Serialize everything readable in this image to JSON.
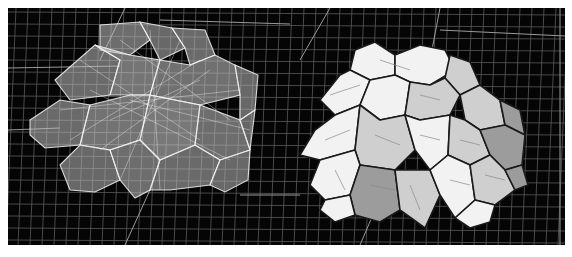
{
  "figure": {
    "width": 572,
    "height": 257,
    "background": "#ffffff",
    "panel": {
      "x": 8,
      "y": 8,
      "w": 557,
      "h": 237,
      "fill": "#050505"
    },
    "colors": {
      "grid_minor": "#5a5a5a",
      "grid_major": "#9a9a9a",
      "wire_edge": "#f4f4f4",
      "solid_edge": "#1a1a1a",
      "face_light": "#f2f2f2",
      "face_mid": "#cfcfcf",
      "face_dark": "#9c9c9c"
    },
    "views": [
      {
        "name": "transparent-wireframe-view",
        "label": ""
      },
      {
        "name": "solid-shaded-view",
        "label": ""
      }
    ]
  },
  "grid": {
    "h_lines": [
      12,
      24,
      36,
      48,
      60,
      72,
      84,
      96,
      108,
      120,
      132,
      144,
      156,
      168,
      180,
      192,
      204,
      216,
      228,
      240
    ],
    "v_lines": [
      10,
      22,
      34,
      46,
      58,
      70,
      82,
      94,
      106,
      118,
      130,
      142,
      154,
      166,
      178,
      190,
      202,
      214,
      226,
      238,
      250,
      262,
      274,
      286,
      298,
      310,
      322,
      334,
      346,
      358,
      370,
      382,
      394,
      406,
      418,
      430,
      442,
      454,
      466,
      478,
      490,
      502,
      514,
      526,
      538,
      550,
      562
    ],
    "major": [
      [
        8,
        68,
        120,
        66
      ],
      [
        8,
        130,
        60,
        128
      ],
      [
        125,
        8,
        100,
        60
      ],
      [
        125,
        245,
        150,
        190
      ],
      [
        160,
        20,
        290,
        24
      ],
      [
        300,
        60,
        330,
        8
      ],
      [
        440,
        8,
        430,
        60
      ],
      [
        440,
        30,
        565,
        36
      ],
      [
        360,
        245,
        375,
        210
      ],
      [
        560,
        8,
        560,
        245
      ],
      [
        240,
        195,
        300,
        195
      ]
    ]
  },
  "left_cluster": {
    "faces": [
      {
        "pts": "100,25 140,22 150,40 130,55 100,50",
        "shade": 0.55
      },
      {
        "pts": "140,22 172,28 185,48 160,60 150,40",
        "shade": 0.45
      },
      {
        "pts": "172,28 205,30 215,55 190,65 185,48",
        "shade": 0.5
      },
      {
        "pts": "55,80 95,45 120,60 110,95 70,100",
        "shade": 0.5
      },
      {
        "pts": "95,45 130,55 160,60 150,95 110,95 120,60",
        "shade": 0.7
      },
      {
        "pts": "160,60 190,65 215,55 235,65 240,95 200,105 150,95",
        "shade": 0.6
      },
      {
        "pts": "235,65 258,75 255,110 240,120 240,95",
        "shade": 0.45
      },
      {
        "pts": "30,120 60,100 90,105 80,145 45,148 30,135",
        "shade": 0.5
      },
      {
        "pts": "90,105 130,95 150,95 140,140 110,150 80,145",
        "shade": 0.65
      },
      {
        "pts": "150,95 200,105 195,145 160,160 140,140",
        "shade": 0.75
      },
      {
        "pts": "200,105 240,120 250,150 220,160 195,145",
        "shade": 0.55
      },
      {
        "pts": "240,120 255,110 250,150",
        "shade": 0.4
      },
      {
        "pts": "60,165 80,145 110,150 120,180 95,192 70,190",
        "shade": 0.45
      },
      {
        "pts": "110,150 140,140 160,160 150,190 135,198 120,180",
        "shade": 0.55
      },
      {
        "pts": "160,160 195,145 220,160 210,185 170,190 150,190",
        "shade": 0.5
      },
      {
        "pts": "220,160 250,150 248,180 225,192 210,185",
        "shade": 0.45
      }
    ],
    "fill": "#bdbdbd",
    "edge": "#f4f4f4"
  },
  "right_cluster": {
    "faces": [
      {
        "pts": "355,50 375,42 395,55 395,75 370,80 350,70",
        "shade": "light"
      },
      {
        "pts": "395,55 420,45 445,50 455,70 430,85 410,82 395,75",
        "shade": "light"
      },
      {
        "pts": "450,55 470,62 480,85 460,95 445,78",
        "shade": "mid"
      },
      {
        "pts": "320,100 340,75 350,70 370,80 360,105 335,115",
        "shade": "light"
      },
      {
        "pts": "370,80 395,75 410,82 405,115 380,120 360,105",
        "shade": "light"
      },
      {
        "pts": "410,82 430,85 445,78 460,95 450,115 420,120 405,115",
        "shade": "mid"
      },
      {
        "pts": "460,95 480,85 500,100 505,125 480,130 465,120",
        "shade": "mid"
      },
      {
        "pts": "500,100 520,110 525,135 505,125",
        "shade": "dark"
      },
      {
        "pts": "300,155 315,130 335,115 360,105 355,150 320,160",
        "shade": "light"
      },
      {
        "pts": "360,105 380,120 405,115 415,150 395,170 360,165 355,150",
        "shade": "mid"
      },
      {
        "pts": "405,115 420,120 450,115 448,155 430,170 415,150",
        "shade": "light"
      },
      {
        "pts": "450,115 465,120 480,130 490,155 470,165 448,155",
        "shade": "mid"
      },
      {
        "pts": "480,130 505,125 525,135 522,165 505,170 490,155",
        "shade": "dark"
      },
      {
        "pts": "310,185 320,160 355,150 360,165 350,195 325,200",
        "shade": "light"
      },
      {
        "pts": "360,165 395,170 400,210 380,222 355,215 350,195",
        "shade": "dark"
      },
      {
        "pts": "395,170 430,170 440,195 425,228 400,210",
        "shade": "mid"
      },
      {
        "pts": "430,170 448,155 470,165 475,200 455,218 440,195",
        "shade": "light"
      },
      {
        "pts": "470,165 490,155 505,170 515,190 495,205 475,200",
        "shade": "mid"
      },
      {
        "pts": "505,170 522,165 528,185 515,190",
        "shade": "dark"
      },
      {
        "pts": "320,210 325,200 350,195 355,215 335,222",
        "shade": "light"
      },
      {
        "pts": "455,218 475,200 495,205 490,222 470,228",
        "shade": "light"
      }
    ],
    "edge": "#1a1a1a"
  }
}
